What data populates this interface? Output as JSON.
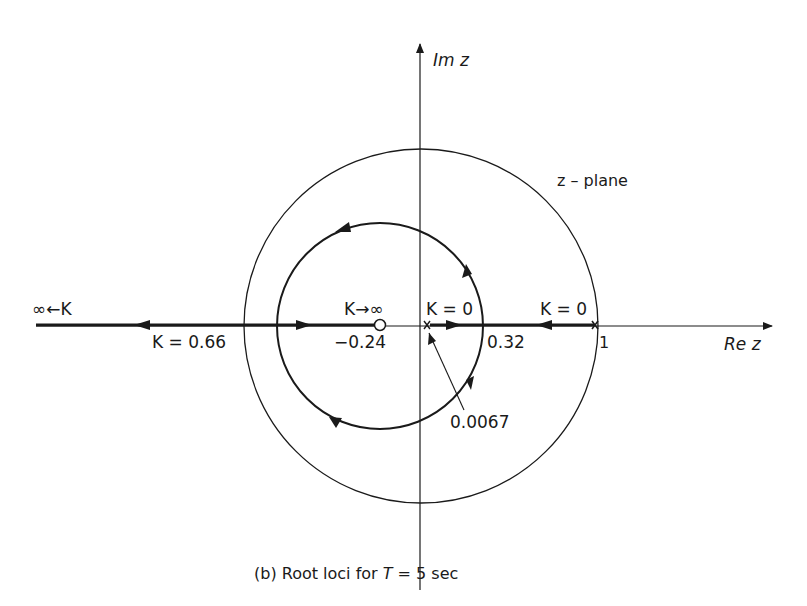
{
  "diagram": {
    "type": "root-locus",
    "caption": "(b)  Root loci  for T = 5 sec",
    "caption_parts": {
      "prefix": "(b)  Root loci  for ",
      "var": "T",
      "suffix": " = 5 sec"
    },
    "plane_label": "z – plane",
    "axes": {
      "imag_label": "Im z",
      "real_label": "Re z"
    },
    "labels": {
      "inf_left": "∞←K",
      "k_066": "K = 0.66",
      "k_inf": "K→∞",
      "minus_024": "−0.24",
      "k0_left": "K = 0",
      "k0_right": "K = 0",
      "val_032": "0.32",
      "val_1": "1",
      "val_00067": "0.0067"
    },
    "poles": [
      0.0067,
      1
    ],
    "zeros": [
      -0.24
    ],
    "breakaway_point": 0.32,
    "break_in_point": -0.24,
    "gain_at_unit_circle_crossing": 0.66,
    "colors": {
      "line": "#1a1a1a",
      "background": "#ffffff"
    }
  }
}
